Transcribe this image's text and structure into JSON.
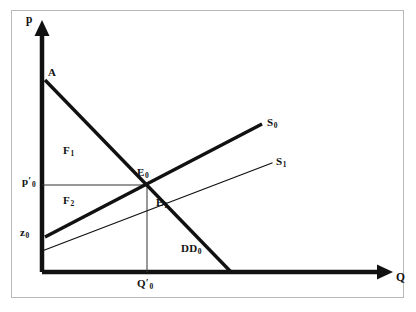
{
  "figure": {
    "kind": "economics-supply-demand-diagram",
    "background_color": "#ffffff",
    "frame_color": "#b9b9b9",
    "ink_color": "#111111"
  },
  "axes": {
    "y_axis_label": "p",
    "x_axis_label": "Q",
    "origin": {
      "x": 42,
      "y": 272
    },
    "y_axis_top": 22,
    "x_axis_right": 392,
    "thick_width": 4,
    "thin_width": 1
  },
  "curves": [
    {
      "id": "demand",
      "label_text": "DD",
      "label_sub": "0",
      "weight": "thick",
      "from": {
        "x": 45,
        "y": 80
      },
      "to": {
        "x": 231,
        "y": 272
      },
      "label_pos": {
        "x": 181,
        "y": 243
      }
    },
    {
      "id": "supply-0",
      "label_text": "S",
      "label_sub": "0",
      "weight": "thick",
      "from": {
        "x": 45,
        "y": 237
      },
      "to": {
        "x": 262,
        "y": 124
      },
      "label_pos": {
        "x": 267,
        "y": 117
      }
    },
    {
      "id": "supply-1",
      "label_text": "S",
      "label_sub": "1",
      "weight": "thin",
      "from": {
        "x": 42,
        "y": 251
      },
      "to": {
        "x": 272,
        "y": 163
      },
      "label_pos": {
        "x": 276,
        "y": 156
      }
    }
  ],
  "guidelines": [
    {
      "id": "price-guide",
      "weight": "thin",
      "from": {
        "x": 42,
        "y": 185
      },
      "to": {
        "x": 147,
        "y": 185
      }
    },
    {
      "id": "quantity-guide",
      "weight": "thin",
      "from": {
        "x": 147,
        "y": 185
      },
      "to": {
        "x": 147,
        "y": 272
      }
    }
  ],
  "points": [
    {
      "id": "intercept-a",
      "text": "A",
      "sub": "",
      "prime": false,
      "pos": {
        "x": 48,
        "y": 67
      }
    },
    {
      "id": "equilibrium-0",
      "text": "E",
      "sub": "0",
      "prime": false,
      "pos": {
        "x": 137,
        "y": 167
      }
    },
    {
      "id": "equilibrium-1",
      "text": "E",
      "sub": "1",
      "prime": false,
      "pos": {
        "x": 156,
        "y": 197
      }
    },
    {
      "id": "region-f1",
      "text": "F",
      "sub": "1",
      "prime": false,
      "pos": {
        "x": 63,
        "y": 145
      }
    },
    {
      "id": "region-f2",
      "text": "F",
      "sub": "2",
      "prime": false,
      "pos": {
        "x": 63,
        "y": 195
      }
    }
  ],
  "axis_ticks": [
    {
      "id": "price-tick",
      "text": "p",
      "sub": "0",
      "prime": true,
      "pos": {
        "x": 22,
        "y": 176
      },
      "axis": "y"
    },
    {
      "id": "reservation-tick",
      "text": "z",
      "sub": "0",
      "prime": false,
      "pos": {
        "x": 20,
        "y": 227
      },
      "axis": "y"
    },
    {
      "id": "quantity-tick",
      "text": "Q",
      "sub": "0",
      "prime": true,
      "pos": {
        "x": 137,
        "y": 278
      },
      "axis": "x"
    }
  ],
  "axis_labels": {
    "y": {
      "text": "p",
      "pos": {
        "x": 26,
        "y": 14
      }
    },
    "x": {
      "text": "Q",
      "pos": {
        "x": 396,
        "y": 272
      }
    }
  },
  "chart_data": {
    "type": "line",
    "title": "",
    "xlabel": "Q",
    "ylabel": "p",
    "grid": false,
    "legend": "inline-curve-labels",
    "series": [
      {
        "name": "DD0",
        "role": "demand",
        "style": "thick",
        "points": [
          [
            0,
            0.955
          ],
          [
            1.0,
            0.0
          ]
        ]
      },
      {
        "name": "S0",
        "role": "supply-initial",
        "style": "thick",
        "points": [
          [
            0,
            0.178
          ],
          [
            1.17,
            0.74
          ]
        ]
      },
      {
        "name": "S1",
        "role": "supply-shifted",
        "style": "thin",
        "points": [
          [
            0,
            0.105
          ],
          [
            1.24,
            0.545
          ]
        ]
      }
    ],
    "annotations": [
      {
        "label": "A",
        "meaning": "demand intercept on price axis"
      },
      {
        "label": "E0",
        "meaning": "equilibrium of DD0 and S0"
      },
      {
        "label": "E1",
        "meaning": "equilibrium of DD0 and S1"
      },
      {
        "label": "F1",
        "meaning": "area above price line, below demand"
      },
      {
        "label": "F2",
        "meaning": "area below price line, above supply"
      },
      {
        "label": "p'0",
        "meaning": "equilibrium price"
      },
      {
        "label": "Q'0",
        "meaning": "equilibrium quantity"
      },
      {
        "label": "z0",
        "meaning": "supply intercept on price axis"
      },
      {
        "label": "DD0",
        "meaning": "demand curve"
      },
      {
        "label": "S0",
        "meaning": "initial supply curve"
      },
      {
        "label": "S1",
        "meaning": "shifted supply curve"
      }
    ]
  }
}
